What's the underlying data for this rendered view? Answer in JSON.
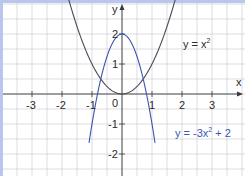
{
  "chart_data": {
    "type": "line",
    "title": "",
    "xlabel": "x",
    "ylabel": "y",
    "xlim": [
      -4,
      4
    ],
    "ylim": [
      -2.7,
      3.1
    ],
    "grid": true,
    "grid_minor_step": 0.5,
    "x_ticks": [
      -3,
      -2,
      -1,
      1,
      2,
      3
    ],
    "x_tick_labels": [
      "-3",
      "-2",
      "-1",
      "1",
      "2",
      "3"
    ],
    "y_ticks": [
      2,
      1,
      -1,
      -2
    ],
    "y_tick_labels": [
      "2",
      "1",
      "-1",
      "-2"
    ],
    "origin_label": "0",
    "series": [
      {
        "name": "y = x²",
        "formula": "x^2",
        "color": "#4a4a55",
        "x": [
          -1.8,
          -1.5,
          -1,
          -0.5,
          0,
          0.5,
          1,
          1.5,
          1.8
        ],
        "values": [
          3.24,
          2.25,
          1,
          0.25,
          0,
          0.25,
          1,
          2.25,
          3.24
        ]
      },
      {
        "name": "y = -3x² + 2",
        "formula": "-3x^2+2",
        "color": "#3a55b0",
        "x": [
          -1.1,
          -1,
          -0.5,
          0,
          0.5,
          1,
          1.1
        ],
        "values": [
          -1.63,
          -1,
          1.25,
          2,
          1.25,
          -1,
          -1.63
        ]
      }
    ],
    "annotations": [
      {
        "text": "y = x²",
        "near": "upper right"
      },
      {
        "text": "y = -3x² + 2",
        "near": "lower right"
      }
    ]
  },
  "labels": {
    "x_axis": "x",
    "y_axis": "y",
    "origin": "0",
    "eq1": "y = x",
    "eq1_sup": "2",
    "eq2_pre": "y = -3x",
    "eq2_sup": "2",
    "eq2_post": " + 2"
  },
  "colors": {
    "grid": "#c8c8cc",
    "axis": "#3a3a3a",
    "frame": "#b8c8ec",
    "curve1": "#4a4a55",
    "curve2": "#3a55b0",
    "eq2_text": "#3a55b0"
  }
}
